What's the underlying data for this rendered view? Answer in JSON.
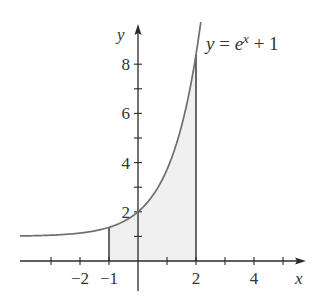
{
  "chart_data": {
    "type": "area",
    "title": "",
    "function_label": "y = e^x + 1",
    "function_label_parts": {
      "lhs": "y",
      "eq": " = ",
      "base": "e",
      "exp": "x",
      "rest": " + 1"
    },
    "xlabel": "x",
    "ylabel": "y",
    "xlim": [
      -4.07,
      5.8
    ],
    "ylim": [
      -1.2,
      9.6
    ],
    "x_ticks": [
      -3,
      -2,
      -1,
      1,
      2,
      3,
      4,
      5
    ],
    "x_tick_labels": [
      {
        "value": -2,
        "label": "−2"
      },
      {
        "value": -1,
        "label": "−1"
      },
      {
        "value": 2,
        "label": "2"
      },
      {
        "value": 4,
        "label": "4"
      }
    ],
    "y_ticks": [
      1,
      2,
      3,
      4,
      5,
      6,
      7,
      8
    ],
    "y_tick_labels": [
      {
        "value": 2,
        "label": "2"
      },
      {
        "value": 4,
        "label": "4"
      },
      {
        "value": 6,
        "label": "6"
      },
      {
        "value": 8,
        "label": "8"
      }
    ],
    "series": [
      {
        "name": "y = e^x + 1",
        "x": [
          -4,
          -3,
          -2,
          -1,
          0,
          1,
          2,
          2.16
        ],
        "y": [
          1.018,
          1.05,
          1.135,
          1.368,
          2.0,
          3.718,
          8.389,
          9.67
        ]
      }
    ],
    "shaded_region": {
      "from_x": -1,
      "to_x": 2,
      "under": "y = e^x + 1",
      "color": "#f0f0f0"
    },
    "grid": false,
    "legend": null,
    "colors": {
      "curve": "#6e6e6e",
      "axis": "#2a2a2a",
      "shade": "#f0f0f0",
      "text": "#333333"
    }
  }
}
